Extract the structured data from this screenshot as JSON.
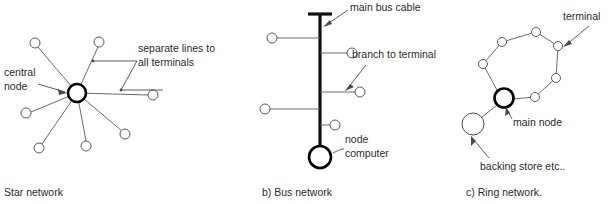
{
  "figure": {
    "background_color": "#ffffff",
    "line_color": "#5a5a5a",
    "bold_color": "#111111",
    "text_color": "#2b2b2b"
  },
  "panels": [
    {
      "id": "star",
      "caption": "Star network",
      "labels": {
        "central_node": "central\nnode",
        "central_node_line1": "central",
        "central_node_line2": "node",
        "separate_lines_line1": "separate lines to",
        "separate_lines_line2": "all terminals"
      },
      "center": {
        "x": 77,
        "y": 93,
        "r": 9
      },
      "terminals": [
        {
          "x": 35,
          "y": 43,
          "r": 5
        },
        {
          "x": 99,
          "y": 42,
          "r": 5
        },
        {
          "x": 153,
          "y": 95,
          "r": 5
        },
        {
          "x": 125,
          "y": 134,
          "r": 5
        },
        {
          "x": 86,
          "y": 146,
          "r": 5
        },
        {
          "x": 39,
          "y": 148,
          "r": 5
        },
        {
          "x": 26,
          "y": 113,
          "r": 5
        }
      ]
    },
    {
      "id": "bus",
      "caption": "b) Bus network",
      "labels": {
        "main_bus_cable": "main bus cable",
        "branch_to_terminal": "branch to terminal",
        "node_computer_line1": "node",
        "node_computer_line2": "computer"
      },
      "cable": {
        "x": 320,
        "y_top": 14,
        "y_bottom": 148
      },
      "cap": {
        "x1": 308,
        "x2": 332,
        "y": 14
      },
      "node_computer": {
        "x": 320,
        "y": 157,
        "r": 11
      },
      "branches": [
        {
          "side": "left",
          "y": 38,
          "x_end": 272,
          "node_r": 5
        },
        {
          "side": "right",
          "y": 53,
          "x_end": 352,
          "node_r": 5
        },
        {
          "side": "right",
          "y": 92,
          "x_end": 360,
          "node_r": 5
        },
        {
          "side": "left",
          "y": 109,
          "x_end": 265,
          "node_r": 5
        },
        {
          "side": "right",
          "y": 125,
          "x_end": 335,
          "node_r": 5
        }
      ]
    },
    {
      "id": "ring",
      "caption": "c) Ring network.",
      "labels": {
        "terminal": "terminal",
        "main_node": "main node",
        "backing_store": "backing store etc.."
      },
      "main_node": {
        "x": 504,
        "y": 98,
        "r": 9.5
      },
      "backing_store": {
        "x": 473,
        "y": 124,
        "r": 11
      },
      "ring_terminals": [
        {
          "x": 502,
          "y": 42,
          "r": 4.5
        },
        {
          "x": 536,
          "y": 32,
          "r": 4.5
        },
        {
          "x": 558,
          "y": 46,
          "r": 4.5
        },
        {
          "x": 556,
          "y": 78,
          "r": 4.5
        },
        {
          "x": 535,
          "y": 97,
          "r": 4.5
        },
        {
          "x": 483,
          "y": 64,
          "r": 4.5
        }
      ]
    }
  ]
}
